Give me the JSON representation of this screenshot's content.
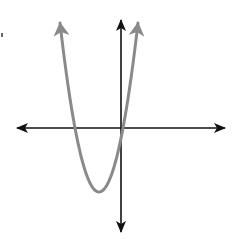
{
  "diagram": {
    "type": "coordinate-plane-graph",
    "axes": {
      "x_axis": {
        "y_px": 128,
        "from_px": 16,
        "to_px": 226,
        "arrows": "both",
        "color": "#111111"
      },
      "y_axis": {
        "x_px": 121,
        "from_px": 19,
        "to_px": 233,
        "arrows": "both",
        "color": "#111111"
      },
      "labels": []
    },
    "curve": {
      "kind": "parabola",
      "opens": "up",
      "color": "#8a8a8a",
      "vertex_px": [
        99,
        192
      ],
      "roots_px": [
        75,
        123
      ],
      "arrow_tips_px": [
        [
          59,
          19
        ],
        [
          139,
          19
        ]
      ],
      "notes": "Vertex left of y-axis and below x-axis; one root negative, one root slightly positive; y-intercept slightly negative"
    }
  }
}
